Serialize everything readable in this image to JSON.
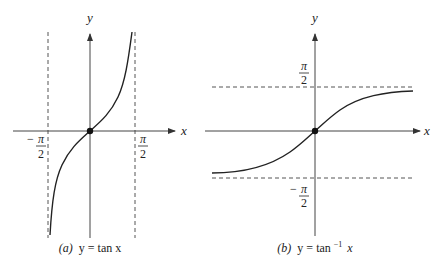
{
  "panels": [
    {
      "id": "a",
      "caption_prefix": "(a)",
      "caption_eq": "y = tan x",
      "function": "tan",
      "x_axis_label": "x",
      "y_axis_label": "y",
      "asymptote_labels": {
        "left_sign": "−",
        "left_num": "π",
        "left_den": "2",
        "right_num": "π",
        "right_den": "2"
      },
      "asymptotes": [
        "x = -π/2",
        "x = π/2"
      ]
    },
    {
      "id": "b",
      "caption_prefix": "(b)",
      "caption_eq_base": "y = tan",
      "caption_sup": "−1",
      "caption_var": "x",
      "function": "arctan",
      "x_axis_label": "x",
      "y_axis_label": "y",
      "asymptote_labels": {
        "top_num": "π",
        "top_den": "2",
        "bottom_sign": "−",
        "bottom_num": "π",
        "bottom_den": "2"
      },
      "asymptotes": [
        "y = π/2",
        "y = -π/2"
      ]
    }
  ],
  "colors": {
    "line": "#222222",
    "axis": "#444444",
    "dash": "#555555",
    "background": "#ffffff"
  }
}
